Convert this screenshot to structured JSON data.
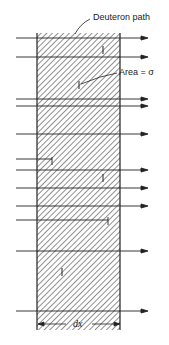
{
  "diagram": {
    "labels": {
      "path_label": "Deuteron path",
      "area_label": "Area = σ",
      "thickness_label": "dx"
    },
    "slab": {
      "x_left": 37,
      "x_right": 120,
      "y_top": 33,
      "y_bottom": 330,
      "hatch": "diagonal"
    },
    "colors": {
      "ink": "#222222",
      "background": "#ffffff"
    },
    "deuteron_paths": [
      {
        "y": 38,
        "ends_at": "arrow"
      },
      {
        "y": 57,
        "ends_at": "arrow"
      },
      {
        "y": 99,
        "ends_at": "arrow"
      },
      {
        "y": 106,
        "ends_at": "arrow"
      },
      {
        "y": 134,
        "ends_at": "arrow"
      },
      {
        "y": 159,
        "ends_at": "stop",
        "stop_x": 52
      },
      {
        "y": 170,
        "ends_at": "arrow"
      },
      {
        "y": 188,
        "ends_at": "arrow"
      },
      {
        "y": 206,
        "ends_at": "arrow"
      },
      {
        "y": 220,
        "ends_at": "stop",
        "stop_x": 108
      },
      {
        "y": 251,
        "ends_at": "arrow"
      },
      {
        "y": 311,
        "ends_at": "arrow"
      }
    ],
    "target_marks": [
      {
        "x": 103,
        "y": 50
      },
      {
        "x": 79,
        "y": 85
      },
      {
        "x": 103,
        "y": 178
      },
      {
        "x": 62,
        "y": 272
      }
    ]
  }
}
